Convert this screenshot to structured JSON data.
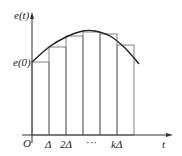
{
  "diagram": {
    "type": "riemann-sum-step-approximation",
    "y_axis_label": "e(t)",
    "x_axis_label": "t",
    "origin_label": "O",
    "y_intercept_label": "e(0)",
    "x_tick_labels": [
      "Δ",
      "2Δ",
      "···",
      "kΔ"
    ],
    "colors": {
      "axis": "#333333",
      "curve": "#222222",
      "rect": "#777777",
      "text": "#222222"
    },
    "geometry": {
      "axis_x": 32,
      "axis_y": 135,
      "x_axis_end": 173,
      "y_axis_top": 12,
      "rect_edges_x": [
        32,
        49,
        66,
        83,
        100,
        117,
        134
      ],
      "rect_tops_y": [
        62,
        47,
        36,
        32,
        34,
        45
      ],
      "curve_points": [
        [
          32,
          62
        ],
        [
          49,
          47
        ],
        [
          66,
          37
        ],
        [
          83,
          31
        ],
        [
          95,
          31
        ],
        [
          110,
          36
        ],
        [
          125,
          48
        ],
        [
          139,
          64
        ]
      ]
    }
  }
}
